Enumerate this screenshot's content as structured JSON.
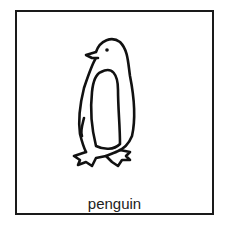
{
  "card": {
    "label": "penguin",
    "icon": "penguin-icon",
    "border_color": "#1a1a1a"
  }
}
